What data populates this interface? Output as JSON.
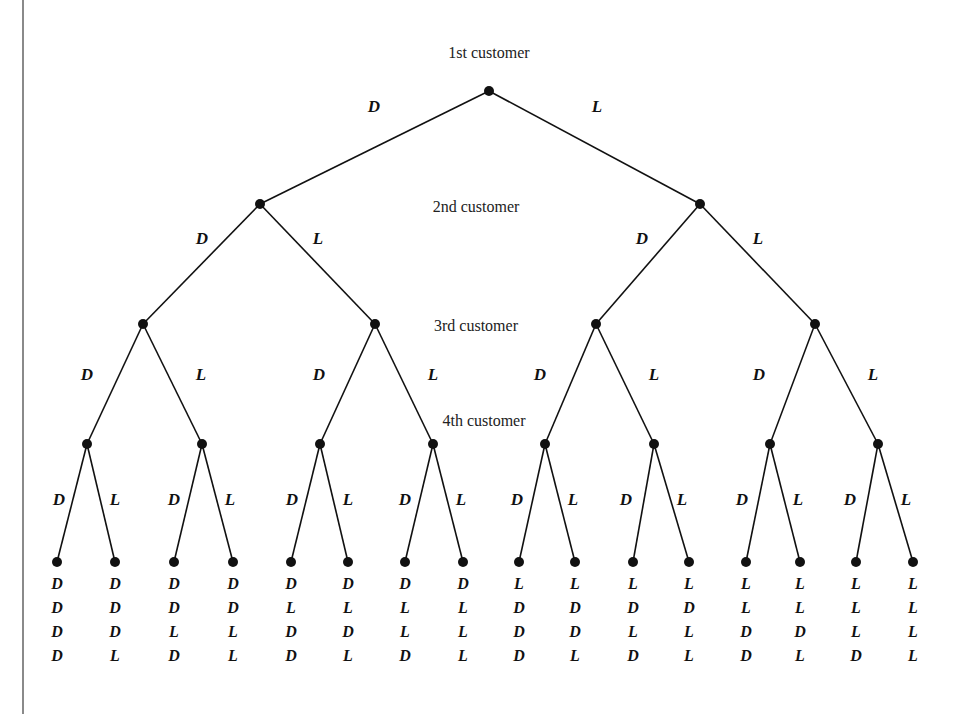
{
  "diagram": {
    "type": "tree",
    "level_labels": [
      {
        "text": "1st customer",
        "x": 489,
        "y": 58
      },
      {
        "text": "2nd customer",
        "x": 476,
        "y": 212
      },
      {
        "text": "3rd customer",
        "x": 476,
        "y": 331
      },
      {
        "text": "4th customer",
        "x": 484,
        "y": 426
      }
    ],
    "branch_symbols": {
      "left": "D",
      "right": "L"
    },
    "levels": [
      {
        "y": 91,
        "nodes": [
          489
        ]
      },
      {
        "y": 204,
        "nodes": [
          260,
          700
        ]
      },
      {
        "y": 324,
        "nodes": [
          143,
          375,
          596,
          815
        ]
      },
      {
        "y": 444,
        "nodes": [
          87,
          202,
          320,
          433,
          545,
          654,
          770,
          878
        ]
      },
      {
        "y": 562,
        "nodes": [
          57,
          115,
          174,
          233,
          291,
          348,
          405,
          463,
          519,
          575,
          633,
          689,
          746,
          800,
          856,
          913
        ]
      }
    ],
    "branch_label_positions": [
      [
        {
          "dx": -115,
          "y": 112
        },
        {
          "dx": 108,
          "y": 112
        }
      ],
      [
        {
          "dx": -58,
          "y": 244
        },
        {
          "dx": 58,
          "y": 244
        }
      ],
      [
        {
          "dx": -56,
          "y": 380
        },
        {
          "dx": 58,
          "y": 380
        }
      ],
      [
        {
          "dx": -28,
          "y": 505
        },
        {
          "dx": 28,
          "y": 505
        }
      ]
    ],
    "outcomes": [
      [
        "D",
        "D",
        "D",
        "D"
      ],
      [
        "D",
        "D",
        "D",
        "L"
      ],
      [
        "D",
        "D",
        "L",
        "D"
      ],
      [
        "D",
        "D",
        "L",
        "L"
      ],
      [
        "D",
        "L",
        "D",
        "D"
      ],
      [
        "D",
        "L",
        "D",
        "L"
      ],
      [
        "D",
        "L",
        "L",
        "D"
      ],
      [
        "D",
        "L",
        "L",
        "L"
      ],
      [
        "L",
        "D",
        "D",
        "D"
      ],
      [
        "L",
        "D",
        "D",
        "L"
      ],
      [
        "L",
        "D",
        "L",
        "D"
      ],
      [
        "L",
        "D",
        "L",
        "L"
      ],
      [
        "L",
        "L",
        "D",
        "D"
      ],
      [
        "L",
        "L",
        "D",
        "L"
      ],
      [
        "L",
        "L",
        "L",
        "D"
      ],
      [
        "L",
        "L",
        "L",
        "L"
      ]
    ],
    "outcome_rows_y": [
      589,
      613,
      637,
      661
    ]
  }
}
